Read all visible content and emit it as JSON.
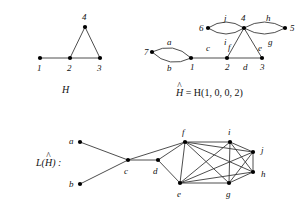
{
  "figure": {
    "stroke_color": "#3a3a3a",
    "node_color": "#000000",
    "background": "#ffffff"
  },
  "panel_H": {
    "caption": "H",
    "nodes": [
      {
        "id": "1",
        "label": "1",
        "x": 40,
        "y": 58,
        "label_x": 37,
        "label_y": 64
      },
      {
        "id": "2",
        "label": "2",
        "x": 70,
        "y": 58,
        "label_x": 67,
        "label_y": 64
      },
      {
        "id": "3",
        "label": "3",
        "x": 100,
        "y": 58,
        "label_x": 97,
        "label_y": 64
      },
      {
        "id": "4",
        "label": "4",
        "x": 85,
        "y": 27,
        "label_x": 82,
        "label_y": 13
      }
    ],
    "edges": [
      {
        "from": "1",
        "to": "2"
      },
      {
        "from": "2",
        "to": "3"
      },
      {
        "from": "2",
        "to": "4"
      },
      {
        "from": "3",
        "to": "4"
      }
    ],
    "caption_x": 62,
    "caption_y": 85
  },
  "panel_Hhat": {
    "caption_prefix": "H",
    "caption_hat": "^",
    "caption_rest": " = H(1, 0, 0, 2)",
    "caption_x": 176,
    "caption_y": 88,
    "nodes": [
      {
        "id": "7",
        "label": "7",
        "x": 152,
        "y": 52,
        "label_x": 144,
        "label_y": 48
      },
      {
        "id": "1",
        "label": "1",
        "x": 191,
        "y": 58,
        "label_x": 190,
        "label_y": 63
      },
      {
        "id": "2",
        "label": "2",
        "x": 227,
        "y": 58,
        "label_x": 225,
        "label_y": 63
      },
      {
        "id": "3",
        "label": "3",
        "x": 262,
        "y": 58,
        "label_x": 260,
        "label_y": 63
      },
      {
        "id": "4",
        "label": "4",
        "x": 244,
        "y": 28,
        "label_x": 241,
        "label_y": 14
      },
      {
        "id": "6",
        "label": "6",
        "x": 208,
        "y": 28,
        "label_x": 199,
        "label_y": 24
      },
      {
        "id": "5",
        "label": "5",
        "x": 285,
        "y": 28,
        "label_x": 290,
        "label_y": 24
      }
    ],
    "edges": [
      {
        "id": "a",
        "from": "7",
        "to": "1",
        "curve": -7,
        "label": "a",
        "label_x": 167,
        "label_y": 38
      },
      {
        "id": "b",
        "from": "7",
        "to": "1",
        "curve": 7,
        "label": "b",
        "label_x": 167,
        "label_y": 64
      },
      {
        "id": "c",
        "from": "1",
        "to": "2",
        "curve": 0,
        "label": "c",
        "label_x": 206,
        "label_y": 44
      },
      {
        "id": "d",
        "from": "2",
        "to": "3",
        "curve": 0,
        "label": "d",
        "label_x": 243,
        "label_y": 63
      },
      {
        "id": "f",
        "from": "2",
        "to": "4",
        "curve": 0,
        "label": "f",
        "label_x": 228,
        "label_y": 43
      },
      {
        "id": "e",
        "from": "3",
        "to": "4",
        "curve": 0,
        "label": "e",
        "label_x": 258,
        "label_y": 44
      },
      {
        "id": "j",
        "from": "6",
        "to": "4",
        "curve": -6,
        "label": "j",
        "label_x": 224,
        "label_y": 14
      },
      {
        "id": "i",
        "from": "6",
        "to": "4",
        "curve": 6,
        "label": "i",
        "label_x": 224,
        "label_y": 38
      },
      {
        "id": "h",
        "from": "4",
        "to": "5",
        "curve": -6,
        "label": "h",
        "label_x": 266,
        "label_y": 14
      },
      {
        "id": "g",
        "from": "4",
        "to": "5",
        "curve": 6,
        "label": "g",
        "label_x": 268,
        "label_y": 38
      }
    ]
  },
  "panel_line_graph": {
    "caption_prefix": "L(",
    "caption_hat_letter": "H",
    "caption_hat": "^",
    "caption_suffix": ") :",
    "caption_x": 36,
    "caption_y": 158,
    "nodes": [
      {
        "id": "a",
        "label": "a",
        "x": 80,
        "y": 142,
        "label_x": 69,
        "label_y": 137
      },
      {
        "id": "b",
        "label": "b",
        "x": 80,
        "y": 184,
        "label_x": 69,
        "label_y": 180
      },
      {
        "id": "c",
        "label": "c",
        "x": 128,
        "y": 160,
        "label_x": 124,
        "label_y": 167
      },
      {
        "id": "d",
        "label": "d",
        "x": 158,
        "y": 160,
        "label_x": 153,
        "label_y": 167
      },
      {
        "id": "f",
        "label": "f",
        "x": 185,
        "y": 142,
        "label_x": 182,
        "label_y": 128
      },
      {
        "id": "i",
        "label": "i",
        "x": 230,
        "y": 142,
        "label_x": 228,
        "label_y": 128
      },
      {
        "id": "e",
        "label": "e",
        "x": 180,
        "y": 183,
        "label_x": 177,
        "label_y": 190
      },
      {
        "id": "g",
        "label": "g",
        "x": 229,
        "y": 183,
        "label_x": 226,
        "label_y": 190
      },
      {
        "id": "j",
        "label": "j",
        "x": 253,
        "y": 152,
        "label_x": 261,
        "label_y": 146
      },
      {
        "id": "h",
        "label": "h",
        "x": 253,
        "y": 172,
        "label_x": 261,
        "label_y": 170
      }
    ],
    "edges": [
      {
        "from": "a",
        "to": "c"
      },
      {
        "from": "b",
        "to": "c"
      },
      {
        "from": "c",
        "to": "d"
      },
      {
        "from": "c",
        "to": "f"
      },
      {
        "from": "d",
        "to": "f"
      },
      {
        "from": "d",
        "to": "e"
      },
      {
        "from": "f",
        "to": "e"
      },
      {
        "from": "f",
        "to": "i"
      },
      {
        "from": "f",
        "to": "g"
      },
      {
        "from": "f",
        "to": "j"
      },
      {
        "from": "f",
        "to": "h"
      },
      {
        "from": "e",
        "to": "i"
      },
      {
        "from": "e",
        "to": "g"
      },
      {
        "from": "e",
        "to": "j"
      },
      {
        "from": "e",
        "to": "h"
      },
      {
        "from": "i",
        "to": "g"
      },
      {
        "from": "i",
        "to": "j"
      },
      {
        "from": "i",
        "to": "h"
      },
      {
        "from": "g",
        "to": "j"
      },
      {
        "from": "g",
        "to": "h"
      },
      {
        "from": "j",
        "to": "h"
      }
    ]
  }
}
